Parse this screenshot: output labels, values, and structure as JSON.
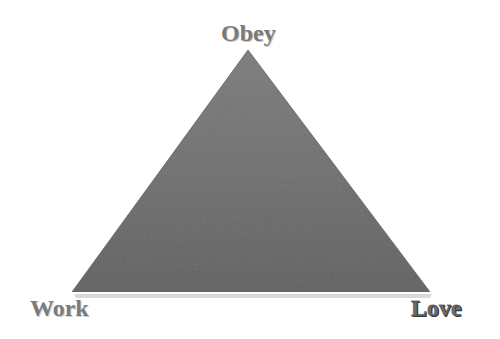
{
  "diagram": {
    "type": "triangle",
    "shape": {
      "fill": "#6f6f6f",
      "fill_light": "#7a7a7a",
      "fill_dark": "#5e5e5e",
      "shadow": "#bdbdbd",
      "vertices": {
        "top": [
          248,
          50
        ],
        "bottom_left": [
          72,
          292
        ],
        "bottom_right": [
          430,
          292
        ]
      }
    },
    "vertices": [
      {
        "position": "top",
        "label": "Obey"
      },
      {
        "position": "bottom-left",
        "label": "Work"
      },
      {
        "position": "bottom-right",
        "label": "Love"
      }
    ]
  }
}
